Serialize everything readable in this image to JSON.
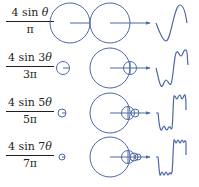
{
  "colors": {
    "stroke": "#4d68a8",
    "text": "#231f20",
    "background": "#ffffff"
  },
  "rows": [
    {
      "numerator_prefix": "4 sin ",
      "numerator_var": "θ",
      "denominator": "π",
      "harmonic": 1,
      "terms": 1
    },
    {
      "numerator_prefix": "4 sin 3",
      "numerator_var": "θ",
      "denominator": "3π",
      "harmonic": 3,
      "terms": 2
    },
    {
      "numerator_prefix": "4 sin 5",
      "numerator_var": "θ",
      "denominator": "5π",
      "harmonic": 5,
      "terms": 3
    },
    {
      "numerator_prefix": "4 sin 7",
      "numerator_var": "θ",
      "denominator": "7π",
      "harmonic": 7,
      "terms": 4
    }
  ]
}
